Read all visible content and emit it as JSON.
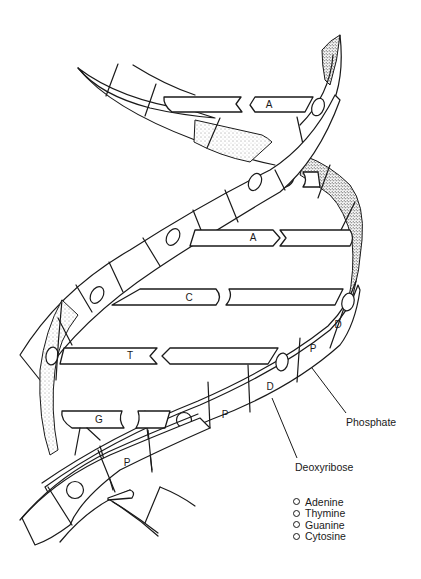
{
  "diagram": {
    "base_pairs": [
      {
        "left": "",
        "right": "A",
        "position": "top"
      },
      {
        "left": "C",
        "right": "",
        "position": "upper-right"
      },
      {
        "left": "A",
        "right": "",
        "position": "upper-middle"
      },
      {
        "left": "C",
        "right": "",
        "position": "middle"
      },
      {
        "left": "T",
        "right": "",
        "position": "lower-middle"
      },
      {
        "left": "G",
        "right": "",
        "position": "bottom"
      }
    ],
    "backbone_labels": {
      "p": "P",
      "d": "D"
    },
    "callouts": {
      "phosphate": "Phosphate",
      "deoxyribose": "Deoxyribose"
    },
    "legend": [
      {
        "label": "Adenine",
        "icon": "circle-outline-icon"
      },
      {
        "label": "Thymine",
        "icon": "circle-outline-icon"
      },
      {
        "label": "Guanine",
        "icon": "circle-outline-icon"
      },
      {
        "label": "Cytosine",
        "icon": "circle-outline-icon"
      }
    ],
    "colors": {
      "ink": "#1a1a1a",
      "background": "#ffffff"
    }
  }
}
